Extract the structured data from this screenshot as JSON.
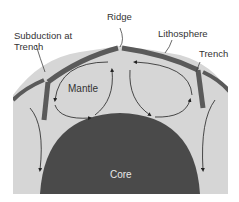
{
  "diagram": {
    "labels": {
      "subduction": "Subduction at",
      "subduction_line2": "Trench",
      "ridge": "Ridge",
      "lithosphere": "Lithosphere",
      "trench": "Trench",
      "mantle": "Mantle",
      "core": "Core"
    },
    "colors": {
      "mantle": "#d6d6d6",
      "core": "#4a4a4a",
      "lithosphere": "#5a5a5a",
      "arrows": "#222222"
    }
  }
}
